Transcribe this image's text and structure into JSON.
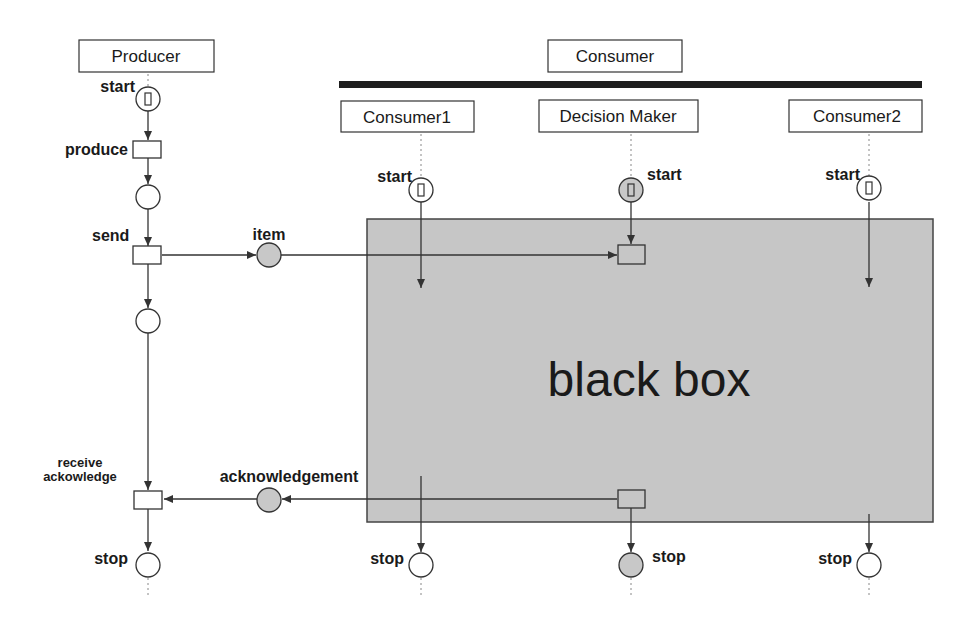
{
  "colors": {
    "line": "#333333",
    "token_place_fill": "#c8c8c8",
    "black_box_fill": "#c6c6c6",
    "bar": "#1e1e1e",
    "text": "#1a1a1a"
  },
  "headers": {
    "producer": "Producer",
    "consumer": "Consumer",
    "consumer1": "Consumer1",
    "decision_maker": "Decision Maker",
    "consumer2": "Consumer2"
  },
  "producer": {
    "start_label": "start",
    "produce_label": "produce",
    "send_label": "send",
    "receive_label_line1": "receive",
    "receive_label_line2": "ackowledge",
    "stop_label": "stop"
  },
  "channels": {
    "item_label": "item",
    "ack_label": "acknowledgement"
  },
  "consumer1": {
    "start_label": "start",
    "stop_label": "stop"
  },
  "decision_maker": {
    "start_label": "start",
    "stop_label": "stop"
  },
  "consumer2": {
    "start_label": "start",
    "stop_label": "stop"
  },
  "black_box": {
    "label": "black box"
  },
  "token_glyph": "[]"
}
